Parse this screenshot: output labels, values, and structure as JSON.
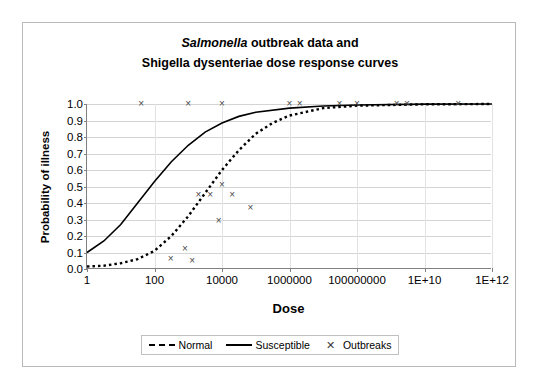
{
  "chart_data": {
    "type": "line",
    "title_line1_italic": "Salmonella",
    "title_line1_rest": " outbreak data and",
    "title_line2": "Shigella dysenteriae dose response curves",
    "xlabel": "Dose",
    "ylabel": "Probability of illness",
    "xscale": "log",
    "xlim": [
      1,
      1000000000000
    ],
    "ylim": [
      0,
      1
    ],
    "grid": true,
    "legend_position": "bottom",
    "xtick_labels": [
      "1",
      "100",
      "10000",
      "1000000",
      "100000000",
      "1E+10",
      "1E+12"
    ],
    "xtick_values": [
      1,
      100,
      10000,
      1000000,
      100000000,
      10000000000,
      1000000000000
    ],
    "ytick_labels": [
      "0.0",
      "0.1",
      "0.2",
      "0.3",
      "0.4",
      "0.5",
      "0.6",
      "0.7",
      "0.8",
      "0.9",
      "1.0"
    ],
    "ytick_values": [
      0.0,
      0.1,
      0.2,
      0.3,
      0.4,
      0.5,
      0.6,
      0.7,
      0.8,
      0.9,
      1.0
    ],
    "series": [
      {
        "name": "Normal",
        "style": "dashed",
        "color": "#000000",
        "points": [
          [
            1,
            0.015
          ],
          [
            3.16,
            0.02
          ],
          [
            10,
            0.035
          ],
          [
            31.6,
            0.06
          ],
          [
            100,
            0.11
          ],
          [
            316,
            0.2
          ],
          [
            1000,
            0.32
          ],
          [
            3160,
            0.46
          ],
          [
            10000,
            0.6
          ],
          [
            31600,
            0.72
          ],
          [
            100000,
            0.82
          ],
          [
            316000,
            0.885
          ],
          [
            1000000,
            0.93
          ],
          [
            10000000,
            0.975
          ],
          [
            100000000,
            0.99
          ],
          [
            10000000000,
            0.998
          ],
          [
            1000000000000,
            1.0
          ]
        ]
      },
      {
        "name": "Susceptible",
        "style": "solid",
        "color": "#000000",
        "points": [
          [
            1,
            0.1
          ],
          [
            3.16,
            0.17
          ],
          [
            10,
            0.27
          ],
          [
            31.6,
            0.4
          ],
          [
            100,
            0.53
          ],
          [
            316,
            0.65
          ],
          [
            1000,
            0.75
          ],
          [
            3160,
            0.83
          ],
          [
            10000,
            0.885
          ],
          [
            31600,
            0.925
          ],
          [
            100000,
            0.95
          ],
          [
            1000000,
            0.975
          ],
          [
            10000000,
            0.988
          ],
          [
            100000000,
            0.994
          ],
          [
            10000000000,
            0.999
          ],
          [
            1000000000000,
            1.0
          ]
        ]
      },
      {
        "name": "Outbreaks",
        "style": "markers",
        "marker": "x",
        "color": "#4a4a4a",
        "points": [
          [
            40,
            1.0
          ],
          [
            1000,
            1.0
          ],
          [
            10000,
            1.0
          ],
          [
            1000000,
            1.0
          ],
          [
            2000000,
            1.0
          ],
          [
            30000000,
            1.0
          ],
          [
            100000000,
            1.0
          ],
          [
            1500000000,
            1.0
          ],
          [
            3000000000,
            1.0
          ],
          [
            100000000000,
            1.0
          ],
          [
            10000,
            0.51
          ],
          [
            2000,
            0.45
          ],
          [
            4500,
            0.45
          ],
          [
            20000,
            0.45
          ],
          [
            70000,
            0.37
          ],
          [
            8000,
            0.29
          ],
          [
            800,
            0.12
          ],
          [
            300,
            0.06
          ],
          [
            1300,
            0.05
          ]
        ]
      }
    ]
  },
  "legend": {
    "items": [
      {
        "label": "Normal",
        "style": "dashed"
      },
      {
        "label": "Susceptible",
        "style": "solid"
      },
      {
        "label": "Outbreaks",
        "style": "marker-x"
      }
    ]
  }
}
